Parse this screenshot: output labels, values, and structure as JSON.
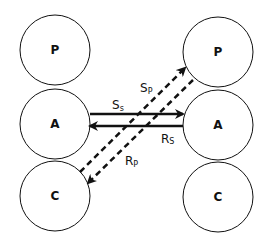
{
  "diagram": {
    "left_column": {
      "nodes": [
        {
          "id": "P",
          "label": "P",
          "cx": 55,
          "cy": 50,
          "r": 35
        },
        {
          "id": "A",
          "label": "A",
          "cx": 55,
          "cy": 124,
          "r": 35
        },
        {
          "id": "C",
          "label": "C",
          "cx": 55,
          "cy": 196,
          "r": 35
        }
      ]
    },
    "right_column": {
      "nodes": [
        {
          "id": "P",
          "label": "P",
          "cx": 218,
          "cy": 52,
          "r": 35
        },
        {
          "id": "A",
          "label": "A",
          "cx": 218,
          "cy": 125,
          "r": 35
        },
        {
          "id": "C",
          "label": "C",
          "cx": 218,
          "cy": 197,
          "r": 35
        }
      ]
    },
    "edges": [
      {
        "id": "Ss",
        "label_main": "S",
        "label_sub": "s",
        "from": "left.A",
        "to": "right.A",
        "style": "solid"
      },
      {
        "id": "Rs",
        "label_main": "R",
        "label_sub": "S",
        "from": "right.A",
        "to": "left.A",
        "style": "solid"
      },
      {
        "id": "Sp",
        "label_main": "S",
        "label_sub": "P",
        "from": "left.C",
        "to": "right.P",
        "style": "dashed"
      },
      {
        "id": "Rp",
        "label_main": "R",
        "label_sub": "P",
        "from": "right.P",
        "to": "left.C",
        "style": "dashed"
      }
    ],
    "colors": {
      "stroke": "#111111",
      "background": "#ffffff"
    }
  }
}
